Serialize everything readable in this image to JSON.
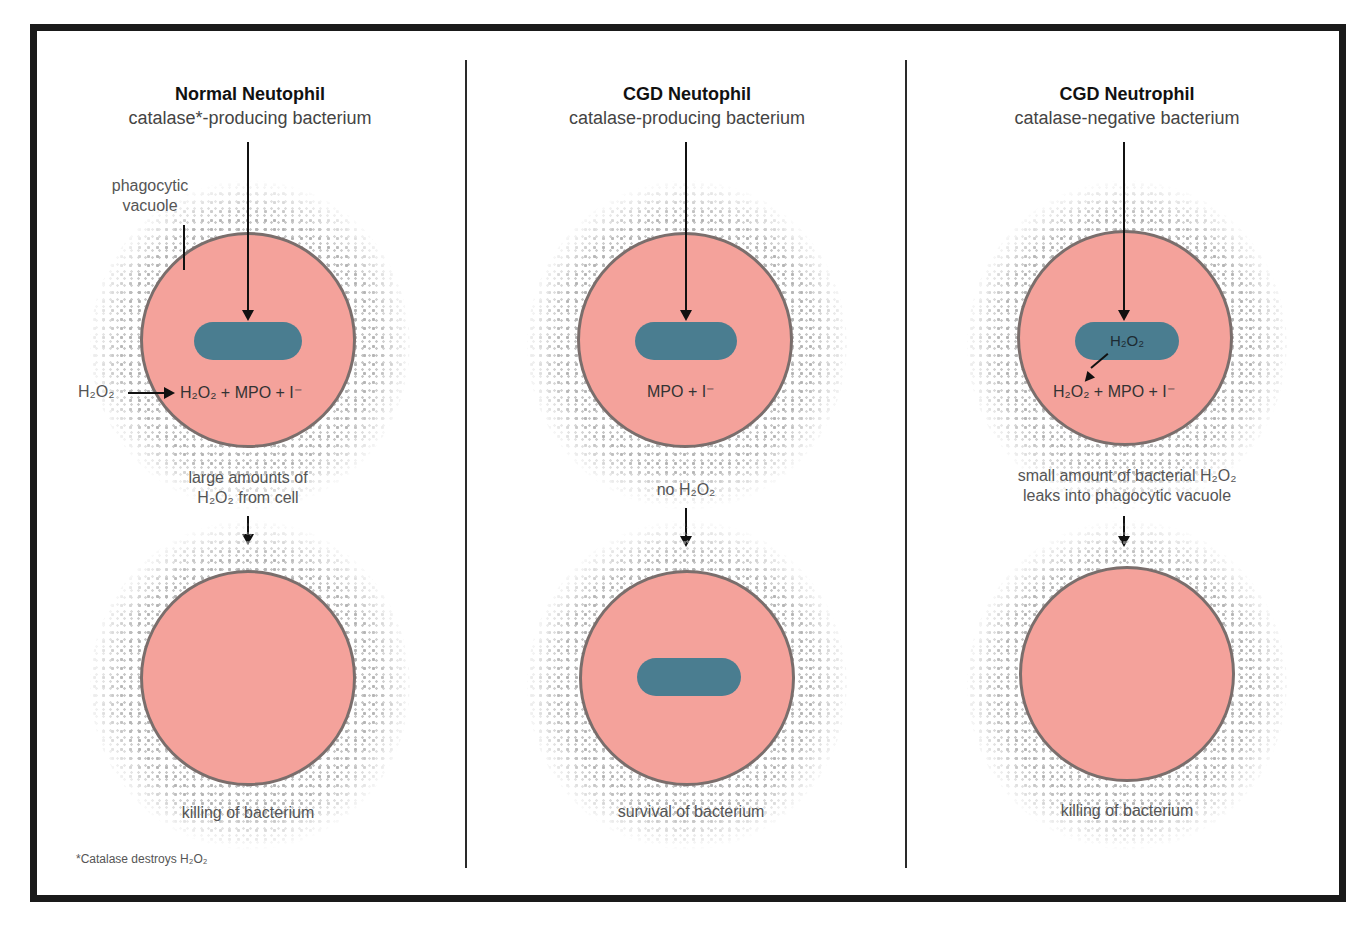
{
  "colors": {
    "cell_fill": "#f4a29b",
    "cell_border": "#7a6e6c",
    "bacterium": "#4a7d90",
    "frame": "#1a1a1a",
    "halo_dots": "#b5b5b5"
  },
  "panels": [
    {
      "title": "Normal Neutophil",
      "subtitle": "catalase*-producing bacterium",
      "vacuole_label_1": "phagocytic",
      "vacuole_label_2": "vacuole",
      "external_h2o2": "H₂O₂",
      "reaction": "H₂O₂ + MPO + I⁻",
      "mid_label_1": "large amounts of",
      "mid_label_2": "H₂O₂ from cell",
      "outcome": "killing of bacterium",
      "bacterium_survives": false
    },
    {
      "title": "CGD Neutophil",
      "subtitle": "catalase-producing bacterium",
      "reaction": "MPO + I⁻",
      "mid_label_1": "no H₂O₂",
      "outcome": "survival of bacterium",
      "bacterium_survives": true
    },
    {
      "title": "CGD Neutrophil",
      "subtitle": "catalase-negative bacterium",
      "bacterium_text": "H₂O₂",
      "reaction": "H₂O₂ + MPO + I⁻",
      "mid_label_1": "small amount of bacterial H₂O₂",
      "mid_label_2": "leaks into phagocytic vacuole",
      "outcome": "killing of bacterium",
      "bacterium_survives": false
    }
  ],
  "footnote": "*Catalase destroys H₂O₂"
}
